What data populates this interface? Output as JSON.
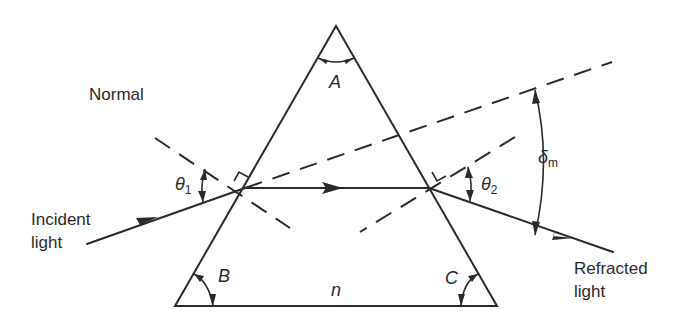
{
  "diagram": {
    "labels": {
      "normal": "Normal",
      "incident_line1": "Incident",
      "incident_line2": "light",
      "refracted_line1": "Refracted",
      "refracted_line2": "light",
      "apex_angle": "A",
      "base_left_angle": "B",
      "base_right_angle": "C",
      "refractive_index": "n",
      "theta": "θ",
      "theta1_sub": "1",
      "theta2_sub": "2",
      "delta": "δ",
      "delta_sub": "m"
    },
    "elements": {
      "prism": {
        "shape": "triangle",
        "vertices": [
          [
            336,
            26
          ],
          [
            175,
            306
          ],
          [
            497,
            306
          ]
        ]
      },
      "incident_ray": {
        "from": [
          87,
          244
        ],
        "to": [
          245,
          188
        ]
      },
      "internal_ray": {
        "from": [
          245,
          188
        ],
        "to": [
          429,
          188
        ]
      },
      "refracted_ray": {
        "from": [
          429,
          188
        ],
        "to": [
          613,
          252
        ]
      },
      "incident_extension": {
        "from": [
          245,
          188
        ],
        "to": [
          612,
          62
        ],
        "style": "dashed"
      },
      "normal_left": {
        "from": [
          155,
          138
        ],
        "to": [
          290,
          228
        ],
        "style": "dashed"
      },
      "normal_right": {
        "from": [
          515,
          137
        ],
        "to": [
          360,
          232
        ],
        "style": "dashed"
      }
    },
    "colors": {
      "line": "#2a2a2a",
      "background": "#ffffff"
    }
  }
}
